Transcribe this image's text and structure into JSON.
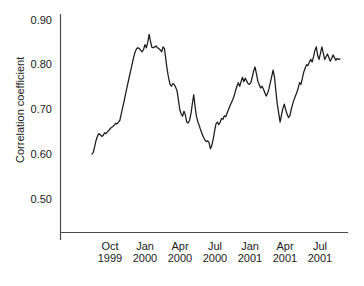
{
  "chart_data": {
    "type": "line",
    "title": "",
    "xlabel": "",
    "ylabel": "Correlation coefficient",
    "ylim": [
      0.45,
      0.9
    ],
    "yticks": [
      "0.90",
      "0.80",
      "0.70",
      "0.60",
      "0.50"
    ],
    "ytick_values": [
      0.9,
      0.8,
      0.7,
      0.6,
      0.5
    ],
    "grid": false,
    "legend": null,
    "xticks": [
      {
        "month": "Oct",
        "year": "1999"
      },
      {
        "month": "Jan",
        "year": "2000"
      },
      {
        "month": "Apr",
        "year": "2000"
      },
      {
        "month": "Jul",
        "year": "2000"
      },
      {
        "month": "Jan",
        "year": "2001"
      },
      {
        "month": "Apr",
        "year": "2001"
      },
      {
        "month": "Jul",
        "year": "2001"
      }
    ],
    "series": [
      {
        "name": "Correlation coefficient",
        "color": "#1a1a1a",
        "values": [
          0.6,
          0.605,
          0.618,
          0.632,
          0.641,
          0.646,
          0.644,
          0.64,
          0.642,
          0.648,
          0.646,
          0.65,
          0.653,
          0.657,
          0.66,
          0.662,
          0.665,
          0.669,
          0.668,
          0.672,
          0.676,
          0.69,
          0.704,
          0.718,
          0.733,
          0.748,
          0.762,
          0.776,
          0.79,
          0.804,
          0.818,
          0.829,
          0.836,
          0.838,
          0.836,
          0.832,
          0.829,
          0.834,
          0.845,
          0.838,
          0.85,
          0.868,
          0.852,
          0.839,
          0.838,
          0.84,
          0.842,
          0.838,
          0.836,
          0.833,
          0.829,
          0.84,
          0.836,
          0.812,
          0.788,
          0.77,
          0.756,
          0.752,
          0.758,
          0.756,
          0.75,
          0.742,
          0.722,
          0.7,
          0.69,
          0.685,
          0.696,
          0.688,
          0.672,
          0.67,
          0.676,
          0.69,
          0.712,
          0.733,
          0.706,
          0.684,
          0.672,
          0.664,
          0.654,
          0.646,
          0.638,
          0.632,
          0.628,
          0.63,
          0.626,
          0.612,
          0.62,
          0.634,
          0.652,
          0.668,
          0.672,
          0.666,
          0.672,
          0.68,
          0.678,
          0.686,
          0.684,
          0.692,
          0.7,
          0.708,
          0.715,
          0.722,
          0.73,
          0.742,
          0.752,
          0.76,
          0.752,
          0.762,
          0.772,
          0.762,
          0.77,
          0.764,
          0.758,
          0.756,
          0.76,
          0.772,
          0.786,
          0.795,
          0.78,
          0.764,
          0.756,
          0.748,
          0.752,
          0.746,
          0.738,
          0.73,
          0.736,
          0.746,
          0.76,
          0.774,
          0.788,
          0.772,
          0.74,
          0.712,
          0.692,
          0.672,
          0.688,
          0.702,
          0.712,
          0.7,
          0.69,
          0.682,
          0.686,
          0.7,
          0.712,
          0.722,
          0.73,
          0.738,
          0.748,
          0.76,
          0.756,
          0.77,
          0.784,
          0.792,
          0.8,
          0.798,
          0.806,
          0.812,
          0.806,
          0.818,
          0.832,
          0.84,
          0.82,
          0.812,
          0.826,
          0.84,
          0.826,
          0.812,
          0.818,
          0.824,
          0.816,
          0.808,
          0.814,
          0.822,
          0.816,
          0.81,
          0.814,
          0.812,
          0.813
        ]
      }
    ]
  },
  "axes": {
    "y_axis_name": "y-axis-line",
    "x_axis_name": "x-axis-line"
  }
}
